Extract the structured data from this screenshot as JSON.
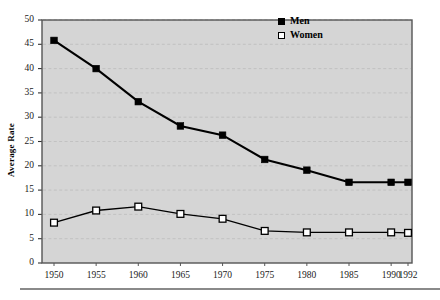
{
  "chart_data": {
    "type": "line",
    "title": "",
    "xlabel": "",
    "ylabel": "Average Rate",
    "categories": [
      "1950",
      "1955",
      "1960",
      "1965",
      "1970",
      "1975",
      "1980",
      "1985",
      "1990",
      "1992"
    ],
    "x": [
      1950,
      1955,
      1960,
      1965,
      1970,
      1975,
      1980,
      1985,
      1990,
      1992
    ],
    "series": [
      {
        "name": "Men",
        "marker": "filled-square",
        "values": [
          45.8,
          40.0,
          33.2,
          28.2,
          26.3,
          21.3,
          19.1,
          16.6,
          16.6,
          16.6
        ]
      },
      {
        "name": "Women",
        "marker": "open-square",
        "values": [
          8.3,
          10.8,
          11.6,
          10.1,
          9.1,
          6.6,
          6.3,
          6.3,
          6.3,
          6.2
        ]
      }
    ],
    "ylim": [
      0,
      50
    ],
    "ytick_labels": [
      "0",
      "5",
      "10",
      "15",
      "20",
      "25",
      "30",
      "35",
      "40",
      "45",
      "50"
    ],
    "yticks": [
      0,
      5,
      10,
      15,
      20,
      25,
      30,
      35,
      40,
      45,
      50
    ],
    "grid": "horizontal-dashed",
    "legend_position": "top-right",
    "plot_background": "#d5d5d5",
    "line_color": "#000000",
    "grid_color": "#bfbfbf",
    "frame_color": "#555555"
  },
  "axis": {
    "y_title": "Average Rate"
  },
  "legend": {
    "entries": [
      {
        "label": "Men"
      },
      {
        "label": "Women"
      }
    ]
  }
}
